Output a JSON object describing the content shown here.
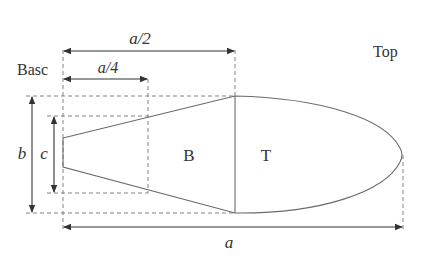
{
  "diagram": {
    "labels": {
      "base": "Basc",
      "top": "Top",
      "half_length": "a/2",
      "quarter_length": "a/4",
      "width": "b",
      "base_width": "c",
      "length": "a",
      "region_base": "B",
      "region_top": "T"
    },
    "colors": {
      "outline": "#6a6a6a",
      "dimension": "#333333",
      "guide": "#777777",
      "background": "#ffffff"
    }
  }
}
